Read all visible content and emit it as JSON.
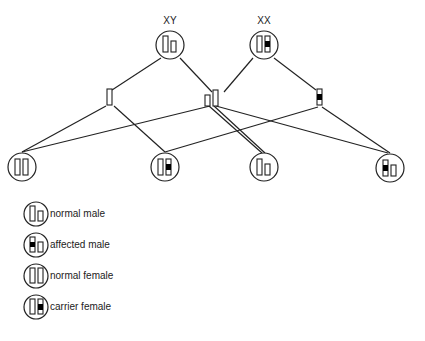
{
  "parents": {
    "father": {
      "label": "XY",
      "type": "normal-male"
    },
    "mother": {
      "label": "XX",
      "type": "carrier-female"
    }
  },
  "gametes": [
    {
      "id": "father-x",
      "type": "normal-x"
    },
    {
      "id": "father-y-x-pair",
      "type": "y-and-x"
    },
    {
      "id": "mother-x-affected",
      "type": "affected-x"
    }
  ],
  "offspring": [
    {
      "type": "normal-female"
    },
    {
      "type": "carrier-female"
    },
    {
      "type": "normal-male"
    },
    {
      "type": "affected-male"
    }
  ],
  "legend": [
    {
      "type": "normal-male",
      "label": "normal male"
    },
    {
      "type": "affected-male",
      "label": "affected male"
    },
    {
      "type": "normal-female",
      "label": "normal female"
    },
    {
      "type": "carrier-female",
      "label": "carrier female"
    }
  ],
  "colors": {
    "stroke": "#222222",
    "fill": "#000000",
    "background": "#ffffff"
  }
}
